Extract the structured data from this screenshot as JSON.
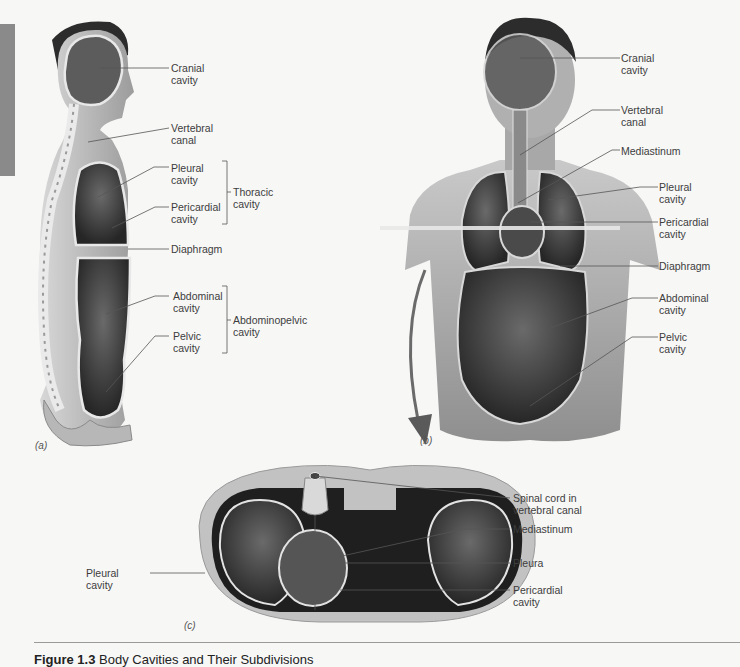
{
  "figure": {
    "caption_number": "Figure 1.3",
    "caption_title": "Body Cavities and Their Subdivisions"
  },
  "panels": {
    "a": {
      "tag": "(a)",
      "labels": {
        "cranial": "Cranial\ncavity",
        "vertebral": "Vertebral\ncanal",
        "pleural": "Pleural\ncavity",
        "pericardial": "Pericardial\ncavity",
        "thoracic": "Thoracic\ncavity",
        "diaphragm": "Diaphragm",
        "abdominal": "Abdominal\ncavity",
        "pelvic": "Pelvic\ncavity",
        "abdominopelvic": "Abdominopelvic\ncavity"
      }
    },
    "b": {
      "tag": "(b)",
      "labels": {
        "cranial": "Cranial\ncavity",
        "vertebral": "Vertebral\ncanal",
        "mediastinum": "Mediastinum",
        "pleural": "Pleural\ncavity",
        "pericardial": "Pericardial\ncavity",
        "diaphragm": "Diaphragm",
        "abdominal": "Abdominal\ncavity",
        "pelvic": "Pelvic\ncavity"
      }
    },
    "c": {
      "tag": "(c)",
      "labels": {
        "spinal_cord": "Spinal cord in\nvertebral canal",
        "mediastinum": "Mediastinum",
        "pleura": "Pleura",
        "pericardial": "Pericardial\ncavity",
        "pleural": "Pleural\ncavity"
      }
    }
  },
  "colors": {
    "background": "#f7f7f6",
    "sidebar": "#8a8a8a",
    "leader_line": "#555555",
    "cavity_dark": "#2a2a2a",
    "skin": "#bdbdbd"
  }
}
